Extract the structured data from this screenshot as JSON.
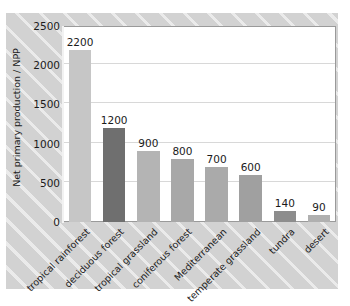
{
  "chart_data": {
    "type": "bar",
    "title": "",
    "xlabel": "",
    "ylabel": "Net primary production / NPP",
    "ylim": [
      0,
      2500
    ],
    "yticks": [
      "0",
      "500",
      "1000",
      "1500",
      "2000",
      "2500"
    ],
    "grid": true,
    "legend": "none",
    "categories": [
      "tropical rainforest",
      "deciduous forest",
      "tropical grassland",
      "coniferous forest",
      "Mediterranean",
      "temperate grassland",
      "tundra",
      "desert"
    ],
    "values": [
      2200,
      1200,
      900,
      800,
      700,
      600,
      140,
      90
    ],
    "value_labels": [
      "2200",
      "1200",
      "900",
      "800",
      "700",
      "600",
      "140",
      "90"
    ],
    "bar_colors": [
      "#c6c6c6",
      "#6f6f6f",
      "#b4b4b4",
      "#a8a8a8",
      "#aaaaaa",
      "#a0a0a0",
      "#8d8d8d",
      "#b0b0b0"
    ]
  },
  "style": {
    "plot_background": "#ffffff",
    "figure_background": "#d2d2d2",
    "grid_color": "#d8d8d8",
    "text_color": "#1b1b1b"
  }
}
